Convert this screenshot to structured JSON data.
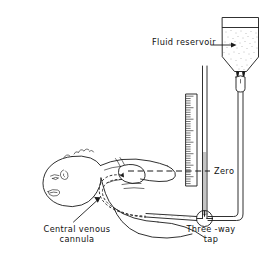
{
  "figure": {
    "type": "line-drawing",
    "background_color": "#ffffff",
    "ink_color": "#1a1a1a"
  },
  "labels": {
    "fluid_reservoir": "Fluid reservoir",
    "zero": "Zero",
    "three_way_tap_line1": "Three -way",
    "three_way_tap_line2": "tap",
    "cannula_line1": "Central  venous",
    "cannula_line2": "cannula"
  },
  "components": {
    "reservoir": "fluid-reservoir-bag",
    "drip_chamber": "drip-chamber",
    "manometer": "manometer-scale",
    "manometer_column": "manometer-column-tube",
    "stopcock": "three-way-stopcock",
    "patient": "infant-figure",
    "heart": "heart-outline",
    "catheter": "central-venous-catheter-path",
    "zero_reference": "zero-reference-line",
    "delivery_tube": "vertical-delivery-tube",
    "horizontal_tube": "horizontal-patient-tube"
  },
  "manometer": {
    "tick_count": 40,
    "has_border": true,
    "orientation": "vertical"
  }
}
